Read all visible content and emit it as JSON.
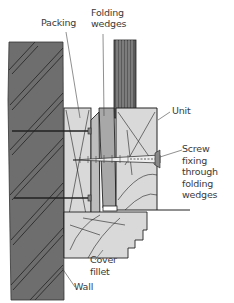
{
  "diagram": {
    "type": "cross-section",
    "labels": {
      "packing": "Packing",
      "folding_wedges": "Folding\nwedges",
      "unit": "Unit",
      "screw_fixing": "Screw\nfixing\nthrough\nfolding\nwedges",
      "cover_fillet": "Cover\nfillet",
      "wall": "Wall"
    },
    "colors": {
      "wall": "#6e6e6e",
      "timber_light": "#d9d9d9",
      "wedge": "#a8a8a8",
      "glass_bars": "#5a5a5a",
      "outline": "#222222",
      "text": "#3a3a3a"
    }
  }
}
